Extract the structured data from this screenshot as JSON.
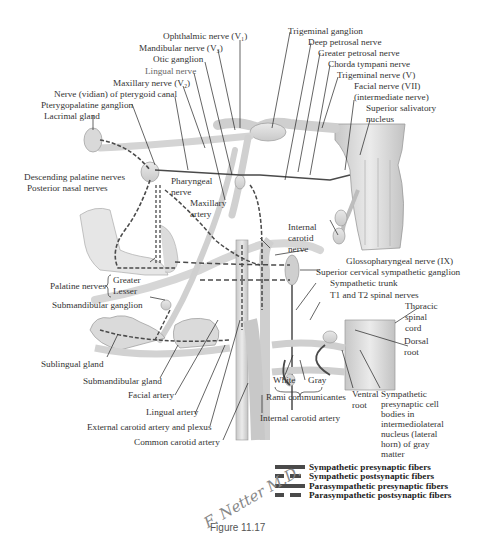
{
  "figure": {
    "type": "anatomical illustration",
    "labels": {
      "ophthalmic_nerve": "Ophthalmic nerve (V₁)",
      "mandibular_nerve": "Mandibular nerve (V₃)",
      "otic_ganglion": "Otic ganglion",
      "lingual_nerve": "Lingual nerve",
      "maxillary_nerve": "Maxillary nerve (V₂)",
      "vidian_nerve": "Nerve (vidian) of pterygoid canal",
      "pterygopalatine_ganglion": "Pterygopalatine ganglion",
      "lacrimal_gland": "Lacrimal gland",
      "trigeminal_ganglion": "Trigeminal ganglion",
      "deep_petrosal_nerve": "Deep petrosal nerve",
      "greater_petrosal_nerve": "Greater petrosal nerve",
      "chorda_tympani_nerve": "Chorda tympani nerve",
      "trigeminal_nerve": "Trigeminal nerve (V)",
      "facial_nerve_1": "Facial nerve (VII)",
      "facial_nerve_2": "(intermediate nerve)",
      "superior_salivatory_1": "Superior salivatory",
      "superior_salivatory_2": "nucleus",
      "descending_palatine_nerves": "Descending palatine nerves",
      "posterior_nasal_nerves": "Posterior nasal nerves",
      "pharyngeal_nerve_1": "Pharyngeal",
      "pharyngeal_nerve_2": "nerve",
      "maxillary_artery_1": "Maxillary",
      "maxillary_artery_2": "artery",
      "internal_carotid_nerve_1": "Internal",
      "internal_carotid_nerve_2": "carotid",
      "internal_carotid_nerve_3": "nerve",
      "glossopharyngeal_nerve": "Glossopharyngeal nerve (IX)",
      "superior_cervical_ganglion": "Superior cervical sympathetic ganglion",
      "sympathetic_trunk": "Sympathetic trunk",
      "t1_t2_spinal_nerves": "T1 and T2 spinal nerves",
      "thoracic_spinal_cord_1": "Thoracic",
      "thoracic_spinal_cord_2": "spinal",
      "thoracic_spinal_cord_3": "cord",
      "dorsal_root_1": "Dorsal",
      "dorsal_root_2": "root",
      "palatine_nerves": "Palatine nerves",
      "greater": "Greater",
      "lesser": "Lesser",
      "submandibular_ganglion": "Submandibular ganglion",
      "sublingual_gland": "Sublingual gland",
      "submandibular_gland": "Submandibular gland",
      "facial_artery": "Facial artery",
      "lingual_artery": "Lingual artery",
      "external_carotid": "External carotid artery and plexus",
      "common_carotid": "Common carotid artery",
      "internal_carotid_artery": "Internal carotid artery",
      "white": "White",
      "gray": "Gray",
      "rami_communicantes": "Rami communicantes",
      "ventral_root_1": "Ventral",
      "ventral_root_2": "root",
      "sympathetic_cell_bodies": "Sympathetic presynaptic cell bodies in intermediolateral nucleus (lateral horn) of gray matter"
    },
    "legend": [
      {
        "style": "solid",
        "label": "Sympathetic presynaptic fibers"
      },
      {
        "style": "dashed",
        "label": "Sympathetic postsynaptic fibers"
      },
      {
        "style": "solid",
        "label": "Parasympathetic presynaptic fibers"
      },
      {
        "style": "dashed",
        "label": "Parasympathetic postsynaptic fibers"
      }
    ],
    "signature": "F. Netter M.D.",
    "caption": "Figure 11.17",
    "colors": {
      "structure_fill": "#d8d8d8",
      "structure_stroke": "#9a9a9a",
      "fiber": "#4a4a4a",
      "leader_line": "#222222",
      "label_text": "#333333"
    }
  }
}
